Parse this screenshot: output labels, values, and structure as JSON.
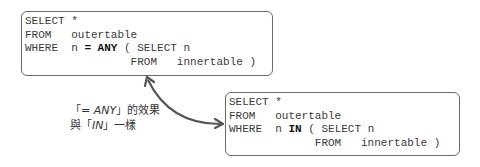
{
  "query_any": {
    "line1": "SELECT *",
    "line2_kw": "FROM",
    "line2_rest": "   outertable",
    "line3_kw": "WHERE",
    "line3_pre": "  n ",
    "line3_op": "= ANY",
    "line3_post": " ( SELECT n",
    "line4": "                FROM   innertable )"
  },
  "query_in": {
    "line1": "SELECT *",
    "line2_kw": "FROM",
    "line2_rest": "   outertable",
    "line3_kw": "WHERE",
    "line3_pre": "  n ",
    "line3_op": "IN",
    "line3_post": " ( SELECT n",
    "line4": "             FROM   innertable )"
  },
  "annotation": {
    "open1": "「",
    "em1": "= ANY",
    "close1": "」的效果",
    "pre2": "與「",
    "em2": "IN",
    "close2": "」一樣"
  },
  "colors": {
    "arrow": "#555555",
    "border": "#6a6a6a"
  }
}
